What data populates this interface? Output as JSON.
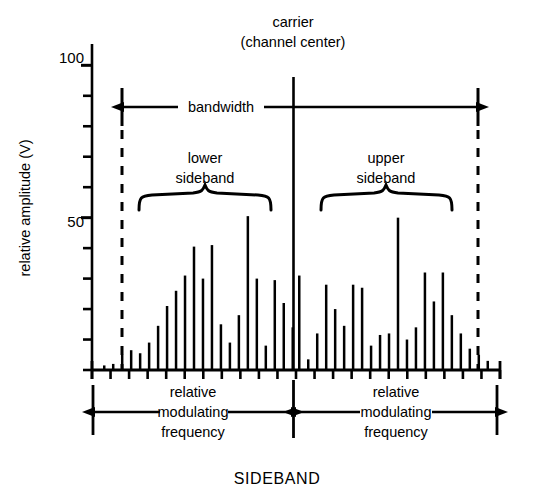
{
  "figure": {
    "caption": "SIDEBAND",
    "y_axis": {
      "title": "relative amplitude (V)",
      "tick_labels": [
        "100",
        "50"
      ],
      "ticks": [
        0,
        10,
        20,
        30,
        40,
        50,
        60,
        70,
        80,
        90,
        100
      ],
      "range": [
        0,
        107
      ]
    },
    "annotations": {
      "carrier_line1": "carrier",
      "carrier_line2": "(channel center)",
      "bandwidth": "bandwidth",
      "lower_sideband_line1": "lower",
      "lower_sideband_line2": "sideband",
      "upper_sideband_line1": "upper",
      "upper_sideband_line2": "sideband",
      "left_freq_line1": "relative",
      "left_freq_line2": "modulating",
      "left_freq_line3": "frequency",
      "right_freq_line1": "relative",
      "right_freq_line2": "modulating",
      "right_freq_line3": "frequency"
    },
    "colors": {
      "ink": "#000000",
      "background": "#ffffff"
    }
  },
  "chart_data": {
    "type": "bar",
    "title": "SIDEBAND",
    "xlabel": "relative modulating frequency",
    "ylabel": "relative amplitude (V)",
    "ylim": [
      0,
      107
    ],
    "xlim": [
      0,
      100
    ],
    "grid": false,
    "legend": "none",
    "carrier": {
      "x": 50.0,
      "value": 107,
      "label": "carrier (channel center)"
    },
    "bandwidth": {
      "from_x": 7.0,
      "to_x": 95.0,
      "label": "bandwidth"
    },
    "braces": [
      {
        "label": "lower sideband",
        "from_x": 11.5,
        "to_x": 44.5
      },
      {
        "label": "upper sideband",
        "from_x": 56.5,
        "to_x": 89.0
      }
    ],
    "x": [
      3.0,
      5.2,
      7.4,
      9.6,
      11.8,
      14.0,
      16.2,
      18.4,
      20.6,
      22.8,
      25.0,
      27.2,
      29.4,
      31.6,
      33.8,
      36.0,
      38.2,
      40.4,
      42.6,
      44.8,
      47.0,
      49.2,
      50.8,
      53.0,
      55.2,
      57.4,
      59.6,
      61.8,
      64.0,
      66.2,
      68.4,
      70.6,
      72.8,
      75.0,
      77.2,
      79.4,
      81.6,
      83.8,
      86.0,
      88.2,
      90.4,
      92.6,
      94.8,
      97.0
    ],
    "values": [
      1.5,
      2.0,
      5.0,
      6.5,
      5.5,
      9.0,
      14.5,
      21.0,
      26.0,
      31.0,
      40.5,
      30.0,
      41.0,
      15.0,
      9.0,
      18.0,
      50.5,
      30.0,
      8.0,
      29.5,
      22.0,
      14.0,
      31.0,
      3.5,
      12.0,
      28.0,
      20.0,
      14.5,
      28.0,
      27.0,
      8.0,
      11.5,
      12.0,
      50.0,
      10.0,
      14.0,
      32.0,
      22.5,
      32.0,
      18.0,
      12.0,
      7.0,
      5.0,
      3.0
    ],
    "series": [
      {
        "name": "lower sideband",
        "x": [
          3.0,
          5.2,
          7.4,
          9.6,
          11.8,
          14.0,
          16.2,
          18.4,
          20.6,
          22.8,
          25.0,
          27.2,
          29.4,
          31.6,
          33.8,
          36.0,
          38.2,
          40.4,
          42.6,
          44.8,
          47.0,
          49.2
        ],
        "values": [
          1.5,
          2.0,
          5.0,
          6.5,
          5.5,
          9.0,
          14.5,
          21.0,
          26.0,
          31.0,
          40.5,
          30.0,
          41.0,
          15.0,
          9.0,
          18.0,
          50.5,
          30.0,
          8.0,
          29.5,
          22.0,
          14.0
        ]
      },
      {
        "name": "upper sideband",
        "x": [
          50.8,
          53.0,
          55.2,
          57.4,
          59.6,
          61.8,
          64.0,
          66.2,
          68.4,
          70.6,
          72.8,
          75.0,
          77.2,
          79.4,
          81.6,
          83.8,
          86.0,
          88.2,
          90.4,
          92.6,
          94.8,
          97.0
        ],
        "values": [
          31.0,
          3.5,
          12.0,
          28.0,
          20.0,
          14.5,
          28.0,
          27.0,
          8.0,
          11.5,
          12.0,
          50.0,
          10.0,
          14.0,
          32.0,
          22.5,
          32.0,
          18.0,
          12.0,
          7.0,
          5.0,
          3.0
        ]
      }
    ]
  }
}
